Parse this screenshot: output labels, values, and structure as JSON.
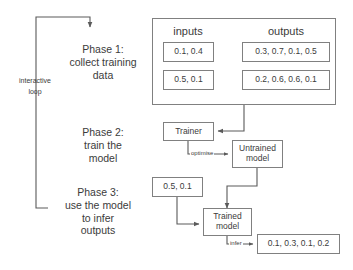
{
  "diagram": {
    "loop": {
      "label": "interactive\nloop"
    },
    "phases": [
      {
        "id": "phase-1",
        "text": "Phase 1:\ncollect training\ndata"
      },
      {
        "id": "phase-2",
        "text": "Phase 2:\ntrain the\nmodel"
      },
      {
        "id": "phase-3",
        "text": "Phase 3:\nuse the model\nto infer\noutputs"
      }
    ],
    "training_data": {
      "column_headers": {
        "inputs": "inputs",
        "outputs": "outputs"
      },
      "rows": [
        {
          "input": "0.1, 0.4",
          "output": "0.3, 0.7, 0.1, 0.5"
        },
        {
          "input": "0.5, 0.1",
          "output": "0.2, 0.6, 0.6, 0.1"
        }
      ]
    },
    "nodes": {
      "trainer": "Trainer",
      "untrained_model": "Untrained\nmodel",
      "trained_model": "Trained\nmodel",
      "inference_input": "0.5, 0.1",
      "inference_output": "0.1, 0.3, 0.1, 0.2"
    },
    "edge_labels": {
      "optimise": "optimise",
      "infer": "infer"
    },
    "colors": {
      "stroke": "#808080",
      "arrow": "#5a5a5a",
      "text": "#3b3b3b",
      "background": "#ffffff"
    }
  }
}
